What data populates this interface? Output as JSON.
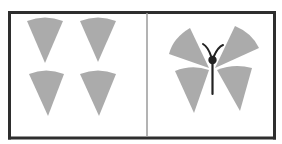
{
  "figure": {
    "colors": {
      "frame": "#2e2e2e",
      "divider": "#9a9a9a",
      "wedge_fill": "#ababab",
      "body": "#222222",
      "background": "#ffffff"
    },
    "panels": [
      {
        "id": "left",
        "label": "",
        "content": "four-wedges",
        "wedge_count": 4
      },
      {
        "id": "right",
        "label": "",
        "content": "butterfly",
        "wedge_count": 4,
        "has_body": true,
        "has_antennae": true
      }
    ]
  }
}
